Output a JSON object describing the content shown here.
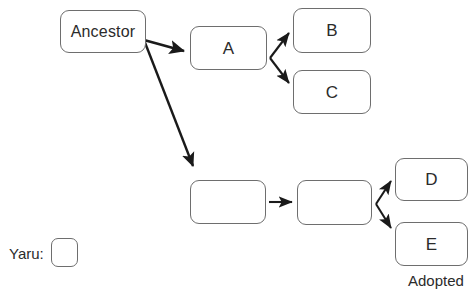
{
  "diagram": {
    "background_color": "#ffffff",
    "node_border_color": "#6e6e6e",
    "text_color": "#2b2b2b",
    "arrow_color": "#1a1a1a",
    "nodes": [
      {
        "id": "ancestor",
        "label": "Ancestor",
        "x": 60,
        "y": 10,
        "w": 86,
        "h": 43
      },
      {
        "id": "a",
        "label": "A",
        "x": 190,
        "y": 26,
        "w": 77,
        "h": 44
      },
      {
        "id": "b",
        "label": "B",
        "x": 293,
        "y": 8,
        "w": 78,
        "h": 45
      },
      {
        "id": "c",
        "label": "C",
        "x": 293,
        "y": 70,
        "w": 78,
        "h": 44
      },
      {
        "id": "p1",
        "label": "",
        "x": 190,
        "y": 180,
        "w": 76,
        "h": 44
      },
      {
        "id": "p2",
        "label": "",
        "x": 297,
        "y": 180,
        "w": 75,
        "h": 45
      },
      {
        "id": "d",
        "label": "D",
        "x": 395,
        "y": 158,
        "w": 73,
        "h": 43
      },
      {
        "id": "e",
        "label": "E",
        "x": 395,
        "y": 222,
        "w": 73,
        "h": 44
      }
    ],
    "labels": [
      {
        "id": "adopted",
        "text": "Adopted",
        "x": 408,
        "y": 273
      },
      {
        "id": "yaru",
        "text": "Yaru:",
        "x": 9,
        "y": 245
      }
    ],
    "legend": {
      "label": "Yaru:",
      "swatch": {
        "x": 51,
        "y": 238,
        "w": 27,
        "h": 29,
        "fill": "#ffffff"
      }
    },
    "edges": [
      {
        "id": "ancestor-to-a",
        "from": "ancestor",
        "to": "a",
        "x1": 144,
        "y1": 40,
        "x2": 186,
        "y2": 52
      },
      {
        "id": "ancestor-to-p1",
        "from": "ancestor",
        "to": "p1",
        "x1": 144,
        "y1": 40,
        "x2": 194,
        "y2": 168
      },
      {
        "id": "a-to-b",
        "from": "a",
        "to": "b",
        "x1": 270,
        "y1": 58,
        "x2": 290,
        "y2": 32
      },
      {
        "id": "a-to-c",
        "from": "a",
        "to": "c",
        "x1": 270,
        "y1": 58,
        "x2": 290,
        "y2": 84
      },
      {
        "id": "p1-to-p2",
        "from": "p1",
        "to": "p2",
        "x1": 269,
        "y1": 202,
        "x2": 294,
        "y2": 202
      },
      {
        "id": "p2-to-d",
        "from": "p2",
        "to": "d",
        "x1": 376,
        "y1": 204,
        "x2": 392,
        "y2": 180
      },
      {
        "id": "p2-to-e",
        "from": "p2",
        "to": "e",
        "x1": 376,
        "y1": 204,
        "x2": 392,
        "y2": 230
      }
    ]
  }
}
